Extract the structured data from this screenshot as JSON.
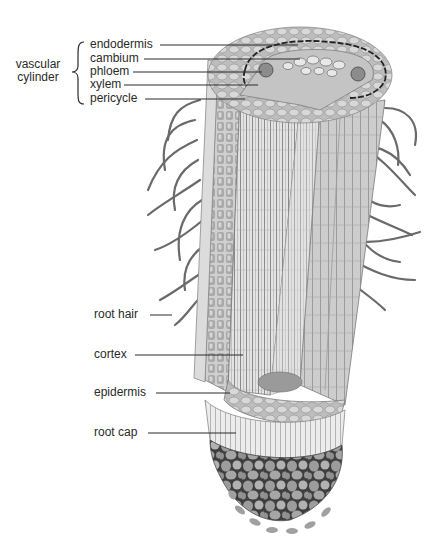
{
  "diagram": {
    "group_label": {
      "line1": "vascular",
      "line2": "cylinder"
    },
    "labels_upper": [
      {
        "id": "endodermis",
        "text": "endodermis"
      },
      {
        "id": "cambium",
        "text": "cambium"
      },
      {
        "id": "phloem",
        "text": "phloem"
      },
      {
        "id": "xylem",
        "text": "xylem"
      },
      {
        "id": "pericycle",
        "text": "pericycle"
      }
    ],
    "labels_lower": [
      {
        "id": "root-hair",
        "text": "root hair"
      },
      {
        "id": "cortex",
        "text": "cortex"
      },
      {
        "id": "epidermis",
        "text": "epidermis"
      },
      {
        "id": "root-cap",
        "text": "root cap"
      }
    ],
    "colors": {
      "ink": "#2a2a2a",
      "cell_light": "#d9d9d9",
      "cell_mid": "#a8a8a8",
      "cell_dark": "#6e6e6e",
      "background": "#ffffff"
    }
  }
}
